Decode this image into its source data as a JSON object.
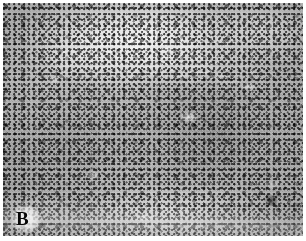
{
  "figure": {
    "kind": "histopathology-micrograph",
    "stain": "hematoxylin-and-eosin",
    "rendering": "grayscale",
    "panel_label": "B",
    "caption": "",
    "dimensions": {
      "width_px": 306,
      "height_px": 241
    },
    "plate": {
      "left_px": 3,
      "top_px": 3,
      "width_px": 300,
      "height_px": 233,
      "margin_color": "#ffffff"
    }
  },
  "palette": {
    "paper_white": "#ffffff",
    "tissue_light": "#d6d6d6",
    "tissue_mid": "#b8b8b8",
    "tissue_dark": "#8f8f8f",
    "nucleus_dark": "#1a1a1a",
    "label_black": "#080808"
  },
  "regions": [
    {
      "name": "stromal-band",
      "description": "pale swirling fibrous stromal band crossing the upper third from upper-left toward centre-right",
      "tone": "light"
    },
    {
      "name": "upper-right-pale-zone",
      "description": "lighter paucicellular zone in the upper-right corner with scattered dark nuclei",
      "tone": "light"
    },
    {
      "name": "dense-cellular-field",
      "description": "densely cellular field of small round dark nuclei occupying the lower two thirds",
      "tone": "dark"
    },
    {
      "name": "lower-pale-band",
      "description": "faint pale horizontal band near the lower edge of the section",
      "tone": "light"
    },
    {
      "name": "dark-focus",
      "description": "small dark rounded focus in the lower-right quadrant",
      "tone": "dark"
    }
  ],
  "label": {
    "text": "B",
    "position": "bottom-left",
    "weight": "bold",
    "color": "#080808"
  }
}
